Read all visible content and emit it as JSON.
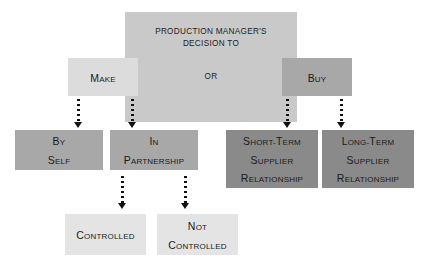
{
  "diagram": {
    "title_lines": [
      "PRODUCTION MANAGER'S",
      "DECISION TO"
    ],
    "or_label": "OR",
    "colors": {
      "background": "#ffffff",
      "header_box": "#c9c9c9",
      "make_box": "#dcdcdc",
      "buy_box": "#a8a8a8",
      "by_self_box": "#a8a8a8",
      "in_partnership_box": "#a8a8a8",
      "short_term_box": "#8a8a8a",
      "long_term_box": "#8a8a8a",
      "controlled_box": "#e4e4e4",
      "not_controlled_box": "#e4e4e4",
      "arrow": "#111111",
      "text": "#1a1a1a"
    },
    "nodes": {
      "header": {
        "id": "header",
        "text": "PRODUCTION MANAGER'S DECISION TO"
      },
      "make": {
        "id": "make",
        "label": "Make",
        "lines": [
          {
            "cap": "M",
            "rest": "AKE"
          }
        ]
      },
      "buy": {
        "id": "buy",
        "label": "Buy",
        "lines": [
          {
            "cap": "B",
            "rest": "UY"
          }
        ]
      },
      "by_self": {
        "id": "by-self",
        "label": "By Self",
        "lines": [
          {
            "cap": "B",
            "rest": "Y"
          },
          {
            "cap": "S",
            "rest": "ELF"
          }
        ]
      },
      "in_partnership": {
        "id": "in-partnership",
        "label": "In Partnership",
        "lines": [
          {
            "cap": "I",
            "rest": "N"
          },
          {
            "cap": "P",
            "rest": "ARTNERSHIP"
          }
        ]
      },
      "short_term": {
        "id": "short-term-supplier-relationship",
        "label": "Short-Term Supplier Relationship",
        "lines": [
          {
            "cap": "S",
            "rest": "HORT-",
            "cap2": "T",
            "rest2": "ERM"
          },
          {
            "cap": "S",
            "rest": "UPPLIER"
          },
          {
            "cap": "R",
            "rest": "ELATIONSHIP"
          }
        ]
      },
      "long_term": {
        "id": "long-term-supplier-relationship",
        "label": "Long-Term Supplier Relationship",
        "lines": [
          {
            "cap": "L",
            "rest": "ONG-",
            "cap2": "T",
            "rest2": "ERM"
          },
          {
            "cap": "S",
            "rest": "UPPLIER"
          },
          {
            "cap": "R",
            "rest": "ELATIONSHIP"
          }
        ]
      },
      "controlled": {
        "id": "controlled",
        "label": "Controlled",
        "lines": [
          {
            "cap": "C",
            "rest": "ONTROLLED"
          }
        ]
      },
      "not_controlled": {
        "id": "not-controlled",
        "label": "Not Controlled",
        "lines": [
          {
            "cap": "N",
            "rest": "OT"
          },
          {
            "cap": "C",
            "rest": "ONTROLLED"
          }
        ]
      }
    },
    "connectors": [
      {
        "id": "make-to-by-self",
        "from": "make",
        "to": "by_self"
      },
      {
        "id": "make-to-in-partnership",
        "from": "make",
        "to": "in_partnership"
      },
      {
        "id": "buy-to-short-term",
        "from": "buy",
        "to": "short_term"
      },
      {
        "id": "buy-to-long-term",
        "from": "buy",
        "to": "long_term"
      },
      {
        "id": "in-partnership-to-controlled",
        "from": "in_partnership",
        "to": "controlled"
      },
      {
        "id": "in-partnership-to-not-controlled",
        "from": "in_partnership",
        "to": "not_controlled"
      }
    ]
  }
}
